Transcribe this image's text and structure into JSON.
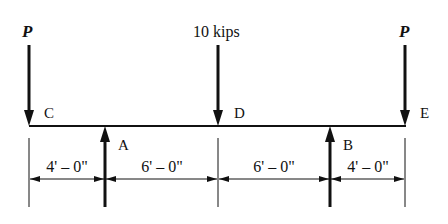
{
  "diagram": {
    "type": "beam-loading",
    "beam": {
      "points": [
        "C",
        "A",
        "D",
        "B",
        "E"
      ]
    },
    "loads": [
      {
        "id": "load-c",
        "label": "P",
        "point": "C",
        "direction": "down"
      },
      {
        "id": "load-d",
        "label": "10 kips",
        "point": "D",
        "direction": "down"
      },
      {
        "id": "load-e",
        "label": "P",
        "point": "E",
        "direction": "down"
      }
    ],
    "reactions": [
      {
        "id": "reaction-a",
        "label": "A",
        "direction": "up"
      },
      {
        "id": "reaction-b",
        "label": "B",
        "direction": "up"
      }
    ],
    "point_labels": {
      "C": "C",
      "D": "D",
      "E": "E"
    },
    "dimensions": [
      {
        "from": "C",
        "to": "A",
        "label": "4' – 0\""
      },
      {
        "from": "A",
        "to": "D",
        "label": "6' – 0\""
      },
      {
        "from": "D",
        "to": "B",
        "label": "6' – 0\""
      },
      {
        "from": "B",
        "to": "E",
        "label": "4' – 0\""
      }
    ],
    "colors": {
      "ink": "#111111",
      "background": "#ffffff"
    }
  }
}
